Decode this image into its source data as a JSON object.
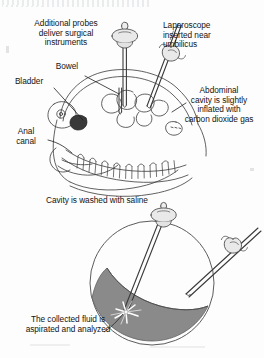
{
  "figure": {
    "title_fragment": "",
    "type": "medical-illustration"
  },
  "panel_upper": {
    "name": "abdominal-insufflation-panel",
    "labels": {
      "additional_probes": "Additional probes\ndeliver surgical\ninstruments",
      "laparoscope": "Laparoscope\ninserted near\numbilicus",
      "bowel": "Bowel",
      "bladder": "Bladder",
      "anal_canal": "Anal\ncanal",
      "abdominal_cavity": "Abdominal\ncavity is slightly\ninflated with\ncarbon dioxide gas"
    }
  },
  "panel_lower": {
    "name": "saline-lavage-panel",
    "labels": {
      "wash": "Cavity is washed with saline",
      "aspirate": "The collected fluid is\naspirated and analyzed"
    }
  },
  "colors": {
    "ink": "#141414",
    "line": "#3a3a3a",
    "fluid": "#8a8a8a",
    "fluid_edge": "#5f5f5f",
    "instrument_fill": "#e8e8e8",
    "background": "#fdfdfd"
  }
}
